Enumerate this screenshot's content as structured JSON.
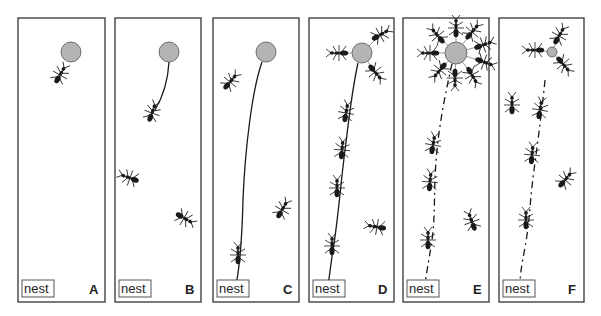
{
  "figure": {
    "colors": {
      "background": "#ffffff",
      "panel_border": "#333333",
      "food": "#b4b4b4",
      "food_border": "#555555",
      "ant": "#1a1a1a",
      "trail": "#1a1a1a"
    },
    "panels": [
      {
        "id": "A",
        "label": "A",
        "nest_label": "nest",
        "x": 18,
        "y": 18,
        "w": 87,
        "h": 284,
        "food": {
          "cx": 71,
          "cy": 52,
          "r": 10
        },
        "trail": null,
        "trail_dashed": false,
        "ants": [
          {
            "x": 60,
            "y": 75,
            "a": 30
          }
        ]
      },
      {
        "id": "B",
        "label": "B",
        "nest_label": "nest",
        "x": 115,
        "y": 18,
        "w": 86,
        "h": 284,
        "food": {
          "cx": 169,
          "cy": 52,
          "r": 10
        },
        "trail": "M169,62 C168,80 164,95 155,110",
        "trail_dashed": false,
        "ants": [
          {
            "x": 152,
            "y": 113,
            "a": 20
          },
          {
            "x": 130,
            "y": 178,
            "a": -70
          },
          {
            "x": 184,
            "y": 218,
            "a": 120
          }
        ]
      },
      {
        "id": "C",
        "label": "C",
        "nest_label": "nest",
        "x": 213,
        "y": 18,
        "w": 86,
        "h": 284,
        "food": {
          "cx": 266,
          "cy": 52,
          "r": 10
        },
        "trail": "M262,62 C252,90 245,150 243,200 C242,240 240,265 236,285",
        "trail_dashed": false,
        "ants": [
          {
            "x": 230,
            "y": 82,
            "a": 40
          },
          {
            "x": 282,
            "y": 210,
            "a": 30
          },
          {
            "x": 238,
            "y": 255,
            "a": 0
          }
        ]
      },
      {
        "id": "D",
        "label": "D",
        "nest_label": "nest",
        "x": 309,
        "y": 18,
        "w": 85,
        "h": 284,
        "food": {
          "cx": 362,
          "cy": 53,
          "r": 10
        },
        "trail": "M358,63 C352,90 350,110 345,150 C340,190 338,220 333,250 C330,270 329,280 328,285",
        "trail_dashed": false,
        "ants": [
          {
            "x": 339,
            "y": 53,
            "a": -90
          },
          {
            "x": 380,
            "y": 35,
            "a": 60
          },
          {
            "x": 375,
            "y": 72,
            "a": 140
          },
          {
            "x": 346,
            "y": 113,
            "a": 10
          },
          {
            "x": 342,
            "y": 150,
            "a": 5
          },
          {
            "x": 337,
            "y": 188,
            "a": 0
          },
          {
            "x": 332,
            "y": 246,
            "a": 0
          },
          {
            "x": 377,
            "y": 227,
            "a": -80
          }
        ]
      },
      {
        "id": "E",
        "label": "E",
        "nest_label": "nest",
        "x": 403,
        "y": 18,
        "w": 86,
        "h": 284,
        "food": {
          "cx": 456,
          "cy": 53,
          "r": 11
        },
        "trail": "M452,64 C446,90 440,120 437,150 C433,190 436,210 432,240 C429,260 426,275 425,285",
        "trail_dashed": true,
        "ants": [
          {
            "x": 456,
            "y": 28,
            "a": 0
          },
          {
            "x": 472,
            "y": 32,
            "a": 40
          },
          {
            "x": 483,
            "y": 45,
            "a": 70
          },
          {
            "x": 484,
            "y": 62,
            "a": 110
          },
          {
            "x": 472,
            "y": 75,
            "a": 150
          },
          {
            "x": 455,
            "y": 78,
            "a": 180
          },
          {
            "x": 440,
            "y": 70,
            "a": -140
          },
          {
            "x": 430,
            "y": 53,
            "a": -90
          },
          {
            "x": 438,
            "y": 36,
            "a": -40
          },
          {
            "x": 433,
            "y": 145,
            "a": 10
          },
          {
            "x": 430,
            "y": 182,
            "a": 5
          },
          {
            "x": 428,
            "y": 240,
            "a": 0
          },
          {
            "x": 472,
            "y": 222,
            "a": -20
          }
        ]
      },
      {
        "id": "F",
        "label": "F",
        "nest_label": "nest",
        "x": 499,
        "y": 18,
        "w": 85,
        "h": 284,
        "food": {
          "cx": 552,
          "cy": 52,
          "r": 5
        },
        "trail": "M545,80 C542,110 538,140 534,170 C530,200 530,215 527,235 C524,255 520,270 520,285",
        "trail_dashed": true,
        "ants": [
          {
            "x": 535,
            "y": 50,
            "a": -90
          },
          {
            "x": 559,
            "y": 36,
            "a": 30
          },
          {
            "x": 563,
            "y": 64,
            "a": 140
          },
          {
            "x": 512,
            "y": 105,
            "a": 0
          },
          {
            "x": 540,
            "y": 110,
            "a": 10
          },
          {
            "x": 532,
            "y": 155,
            "a": 5
          },
          {
            "x": 526,
            "y": 220,
            "a": 0
          },
          {
            "x": 565,
            "y": 180,
            "a": 40
          }
        ]
      }
    ]
  }
}
